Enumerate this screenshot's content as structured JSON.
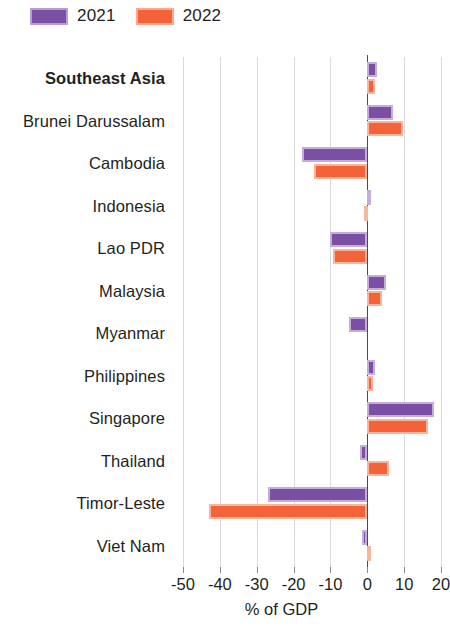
{
  "legend": {
    "entries": [
      {
        "label": "2021",
        "color": "#7b4fa3"
      },
      {
        "label": "2022",
        "color": "#f4623a"
      }
    ]
  },
  "axis": {
    "title": "% of GDP",
    "ticks": [
      "-50",
      "-40",
      "-30",
      "-20",
      "-10",
      "0",
      "10",
      "20"
    ]
  },
  "chart_data": {
    "type": "bar",
    "orientation": "horizontal",
    "title": "",
    "xlabel": "% of GDP",
    "ylabel": "",
    "xlim": [
      -50,
      20
    ],
    "xticks": [
      -50,
      -40,
      -30,
      -20,
      -10,
      0,
      10,
      20
    ],
    "grid": true,
    "legend_position": "top-left",
    "categories": [
      "Southeast Asia",
      "Brunei Darussalam",
      "Cambodia",
      "Indonesia",
      "Lao PDR",
      "Malaysia",
      "Myanmar",
      "Philippines",
      "Singapore",
      "Thailand",
      "Timor-Leste",
      "Viet Nam"
    ],
    "series": [
      {
        "name": "2021",
        "color": "#7b4fa3",
        "values": [
          2.6,
          7.0,
          -17.7,
          0.3,
          -10.0,
          5.0,
          -5.0,
          2.0,
          18.2,
          -2.0,
          -27.0,
          -1.5
        ]
      },
      {
        "name": "2022",
        "color": "#f4623a",
        "values": [
          2.0,
          9.6,
          -14.4,
          -1.0,
          -9.4,
          4.0,
          0.0,
          1.5,
          16.5,
          6.0,
          -43.0,
          1.0
        ]
      }
    ]
  }
}
